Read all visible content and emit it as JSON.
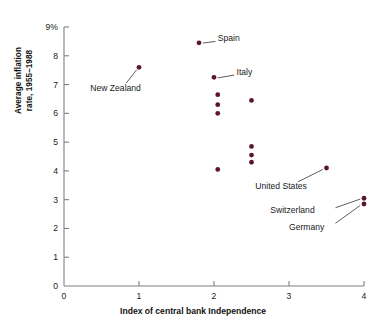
{
  "chart_data": {
    "type": "scatter",
    "title": "",
    "xlabel": "Index of central bank Independence",
    "ylabel": "Average inflation\nrate, 1955–1988",
    "xlim": [
      0,
      4
    ],
    "ylim": [
      0,
      9
    ],
    "xticks": [
      "0",
      "1",
      "2",
      "3",
      "4"
    ],
    "xtick_values": [
      0,
      1,
      2,
      3,
      4
    ],
    "yticks": [
      "0",
      "1",
      "2",
      "3",
      "4",
      "5",
      "6",
      "7",
      "8",
      "9%"
    ],
    "ytick_values": [
      0,
      1,
      2,
      3,
      4,
      5,
      6,
      7,
      8,
      9
    ],
    "grid": false,
    "legend": false,
    "marker_color": "#5c1630",
    "axis_color": "#808080",
    "points": [
      {
        "x": 1.0,
        "y": 7.6,
        "label": "New Zealand",
        "label_x": 0.35,
        "label_y": 6.85,
        "label_align": "left"
      },
      {
        "x": 1.8,
        "y": 8.45,
        "label": "Spain",
        "label_x": 2.05,
        "label_y": 8.6,
        "label_align": "left"
      },
      {
        "x": 2.0,
        "y": 7.25,
        "label": "Italy",
        "label_x": 2.3,
        "label_y": 7.4,
        "label_align": "left"
      },
      {
        "x": 2.05,
        "y": 6.65,
        "label": "",
        "label_x": null,
        "label_y": null,
        "label_align": "left"
      },
      {
        "x": 2.05,
        "y": 6.3,
        "label": "",
        "label_x": null,
        "label_y": null,
        "label_align": "left"
      },
      {
        "x": 2.05,
        "y": 6.0,
        "label": "",
        "label_x": null,
        "label_y": null,
        "label_align": "left"
      },
      {
        "x": 2.5,
        "y": 6.45,
        "label": "",
        "label_x": null,
        "label_y": null,
        "label_align": "left"
      },
      {
        "x": 2.5,
        "y": 4.85,
        "label": "",
        "label_x": null,
        "label_y": null,
        "label_align": "left"
      },
      {
        "x": 2.5,
        "y": 4.55,
        "label": "",
        "label_x": null,
        "label_y": null,
        "label_align": "left"
      },
      {
        "x": 2.5,
        "y": 4.3,
        "label": "",
        "label_x": null,
        "label_y": null,
        "label_align": "left"
      },
      {
        "x": 2.05,
        "y": 4.05,
        "label": "",
        "label_x": null,
        "label_y": null,
        "label_align": "left"
      },
      {
        "x": 3.5,
        "y": 4.1,
        "label": "United States",
        "label_x": 2.55,
        "label_y": 3.45,
        "label_align": "left"
      },
      {
        "x": 4.0,
        "y": 3.05,
        "label": "Switzerland",
        "label_x": 2.75,
        "label_y": 2.6,
        "label_align": "left"
      },
      {
        "x": 4.0,
        "y": 2.85,
        "label": "Germany",
        "label_x": 3.0,
        "label_y": 2.0,
        "label_align": "left"
      }
    ],
    "leaders": [
      {
        "from_x": 0.83,
        "from_y": 7.05,
        "to_x": 0.97,
        "to_y": 7.52
      },
      {
        "from_x": 2.02,
        "from_y": 8.5,
        "to_x": 1.85,
        "to_y": 8.44
      },
      {
        "from_x": 2.27,
        "from_y": 7.33,
        "to_x": 2.05,
        "to_y": 7.23
      },
      {
        "from_x": 3.12,
        "from_y": 3.62,
        "to_x": 3.45,
        "to_y": 4.05
      },
      {
        "from_x": 3.62,
        "from_y": 2.72,
        "to_x": 3.95,
        "to_y": 3.02
      },
      {
        "from_x": 3.62,
        "from_y": 2.18,
        "to_x": 3.95,
        "to_y": 2.8
      }
    ]
  }
}
